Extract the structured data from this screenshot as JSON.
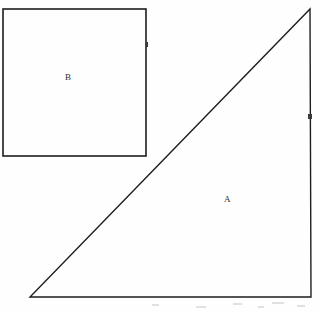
{
  "figure": {
    "background_color": "#fefefe",
    "stroke_color": "#1d1d1d",
    "label_color": "#2b2b2b",
    "width": 318,
    "height": 311
  },
  "shapes": [
    {
      "id": "triangle-a",
      "type": "right-triangle",
      "label": "A",
      "label_position": {
        "x": 228,
        "y": 200
      },
      "vertices": [
        {
          "x": 30,
          "y": 297
        },
        {
          "x": 311,
          "y": 297
        },
        {
          "x": 310,
          "y": 9
        }
      ],
      "stroke_color": "#1d1d1d",
      "stroke_width": 1.4,
      "fill": "none"
    },
    {
      "id": "square-b",
      "type": "square",
      "label": "B",
      "label_position": {
        "x": 69,
        "y": 78
      },
      "x": 3,
      "y": 9,
      "width": 143,
      "height": 147,
      "stroke_color": "#1d1d1d",
      "stroke_width": 1.6,
      "fill": "none"
    }
  ],
  "marks": [
    {
      "id": "tick-square-right-edge",
      "x": 146,
      "y": 44,
      "width": 2,
      "height": 4
    },
    {
      "id": "tick-triangle-right-edge",
      "x": 309,
      "y": 116,
      "width": 3,
      "height": 4
    }
  ],
  "specks": [
    {
      "x": 152,
      "y": 304,
      "width": 7,
      "height": 2
    },
    {
      "x": 196,
      "y": 306,
      "width": 10,
      "height": 2
    },
    {
      "x": 233,
      "y": 303,
      "width": 9,
      "height": 2
    },
    {
      "x": 258,
      "y": 306,
      "width": 6,
      "height": 2
    },
    {
      "x": 272,
      "y": 302,
      "width": 12,
      "height": 2
    },
    {
      "x": 297,
      "y": 305,
      "width": 8,
      "height": 2
    }
  ]
}
